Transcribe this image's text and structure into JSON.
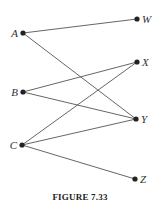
{
  "figure": {
    "caption": "FIGURE 7.33",
    "type": "bipartite graph",
    "colors": {
      "edge": "#555555",
      "node": "#222222",
      "label": "#333333"
    },
    "nodes": [
      {
        "id": "A",
        "label": "A",
        "x": 23,
        "y": 33,
        "side": "left"
      },
      {
        "id": "B",
        "label": "B",
        "x": 23,
        "y": 92,
        "side": "left"
      },
      {
        "id": "C",
        "label": "C",
        "x": 22,
        "y": 145,
        "side": "left"
      },
      {
        "id": "W",
        "label": "W",
        "x": 137,
        "y": 19,
        "side": "right"
      },
      {
        "id": "X",
        "label": "X",
        "x": 137,
        "y": 62,
        "side": "right"
      },
      {
        "id": "Y",
        "label": "Y",
        "x": 136,
        "y": 119,
        "side": "right"
      },
      {
        "id": "Z",
        "label": "Z",
        "x": 135,
        "y": 179,
        "side": "right"
      }
    ],
    "edges": [
      {
        "from": "A",
        "to": "W"
      },
      {
        "from": "A",
        "to": "Y"
      },
      {
        "from": "B",
        "to": "X"
      },
      {
        "from": "B",
        "to": "Y"
      },
      {
        "from": "C",
        "to": "X"
      },
      {
        "from": "C",
        "to": "Y"
      },
      {
        "from": "C",
        "to": "Z"
      }
    ]
  }
}
